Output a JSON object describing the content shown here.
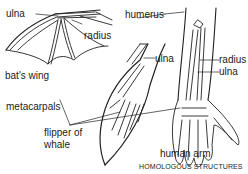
{
  "diagram": {
    "title": "HOMOLOGOUS STRUCTURES",
    "figures": [
      {
        "name": "bat's wing",
        "labels": [
          "ulna",
          "radius"
        ]
      },
      {
        "name": "flipper of whale",
        "labels": [
          "ulna"
        ]
      },
      {
        "name": "human arm",
        "labels": [
          "humerus",
          "radius",
          "ulna"
        ]
      }
    ],
    "labels": {
      "ulna_bat": "ulna",
      "radius_bat": "radius",
      "bats_wing": "bat's wing",
      "humerus": "humerus",
      "ulna_whale": "ulna",
      "radius_human": "radius",
      "ulna_human": "ulna",
      "metacarpals": "metacarpals",
      "flipper_line1": "flipper of",
      "flipper_line2": "whale",
      "human_arm": "human arm",
      "caption": "HOMOLOGOUS STRUCTURES"
    },
    "colors": {
      "line": "#222222",
      "background": "#ffffff"
    }
  }
}
